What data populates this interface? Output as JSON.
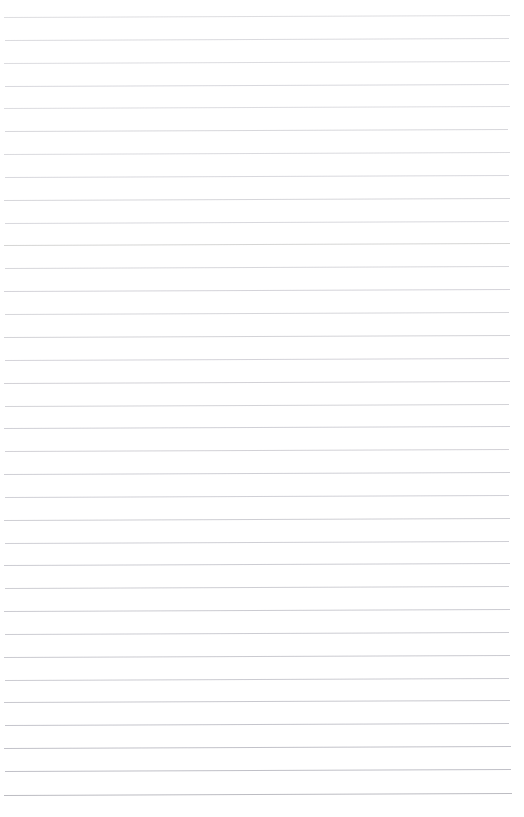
{
  "document": {
    "kind": "ruled-paper",
    "title": "Blank Lined Notebook Page",
    "page_width": 524,
    "page_height": 817,
    "background_color": "#ffffff",
    "has_text": false,
    "has_margin_rule": false,
    "has_header": false,
    "has_footer": false,
    "body_text": ""
  },
  "ruling": {
    "line_count": 35,
    "first_line_y": 17,
    "line_spacing": 22.9,
    "line_start_x": 4,
    "line_end_x": 510,
    "line_thickness": 1,
    "line_color_top": "#d2d2d6",
    "line_color_bottom": "#bcbcc2",
    "slope_px": -2,
    "lines": [
      {
        "index": 1,
        "y": 17,
        "x1": 4,
        "x2": 510,
        "color": "#d4d4d8",
        "opacity": 0.8
      },
      {
        "index": 2,
        "y": 40,
        "x1": 5,
        "x2": 509,
        "color": "#d2d2d7",
        "opacity": 0.82
      },
      {
        "index": 3,
        "y": 63,
        "x1": 4,
        "x2": 510,
        "color": "#d3d3d8",
        "opacity": 0.8
      },
      {
        "index": 4,
        "y": 86,
        "x1": 5,
        "x2": 509,
        "color": "#d1d1d6",
        "opacity": 0.84
      },
      {
        "index": 5,
        "y": 108,
        "x1": 4,
        "x2": 510,
        "color": "#d3d3d8",
        "opacity": 0.8
      },
      {
        "index": 6,
        "y": 131,
        "x1": 5,
        "x2": 508,
        "color": "#d0d0d5",
        "opacity": 0.85
      },
      {
        "index": 7,
        "y": 154,
        "x1": 4,
        "x2": 510,
        "color": "#d2d2d7",
        "opacity": 0.82
      },
      {
        "index": 8,
        "y": 177,
        "x1": 5,
        "x2": 509,
        "color": "#d1d1d6",
        "opacity": 0.84
      },
      {
        "index": 9,
        "y": 200,
        "x1": 4,
        "x2": 510,
        "color": "#cfcfd4",
        "opacity": 0.86
      },
      {
        "index": 10,
        "y": 223,
        "x1": 5,
        "x2": 509,
        "color": "#d1d1d6",
        "opacity": 0.84
      },
      {
        "index": 11,
        "y": 245,
        "x1": 4,
        "x2": 510,
        "color": "#cececd",
        "opacity": 0.86
      },
      {
        "index": 12,
        "y": 268,
        "x1": 5,
        "x2": 509,
        "color": "#d0d0d5",
        "opacity": 0.85
      },
      {
        "index": 13,
        "y": 291,
        "x1": 4,
        "x2": 510,
        "color": "#cecdd3",
        "opacity": 0.87
      },
      {
        "index": 14,
        "y": 314,
        "x1": 5,
        "x2": 509,
        "color": "#cfcfd4",
        "opacity": 0.86
      },
      {
        "index": 15,
        "y": 337,
        "x1": 4,
        "x2": 510,
        "color": "#cdcdd2",
        "opacity": 0.88
      },
      {
        "index": 16,
        "y": 360,
        "x1": 5,
        "x2": 509,
        "color": "#cecdd3",
        "opacity": 0.87
      },
      {
        "index": 17,
        "y": 383,
        "x1": 4,
        "x2": 510,
        "color": "#cccbd1",
        "opacity": 0.89
      },
      {
        "index": 18,
        "y": 406,
        "x1": 5,
        "x2": 509,
        "color": "#cdcdd2",
        "opacity": 0.88
      },
      {
        "index": 19,
        "y": 428,
        "x1": 4,
        "x2": 510,
        "color": "#cbcbd1",
        "opacity": 0.9
      },
      {
        "index": 20,
        "y": 451,
        "x1": 5,
        "x2": 509,
        "color": "#cccbd1",
        "opacity": 0.89
      },
      {
        "index": 21,
        "y": 474,
        "x1": 4,
        "x2": 510,
        "color": "#cacad0",
        "opacity": 0.9
      },
      {
        "index": 22,
        "y": 497,
        "x1": 5,
        "x2": 509,
        "color": "#cbcbd1",
        "opacity": 0.9
      },
      {
        "index": 23,
        "y": 520,
        "x1": 4,
        "x2": 510,
        "color": "#c9c9cf",
        "opacity": 0.91
      },
      {
        "index": 24,
        "y": 543,
        "x1": 5,
        "x2": 509,
        "color": "#cacad0",
        "opacity": 0.9
      },
      {
        "index": 25,
        "y": 565,
        "x1": 4,
        "x2": 510,
        "color": "#c8c8ce",
        "opacity": 0.92
      },
      {
        "index": 26,
        "y": 588,
        "x1": 5,
        "x2": 509,
        "color": "#c9c9cf",
        "opacity": 0.91
      },
      {
        "index": 27,
        "y": 611,
        "x1": 4,
        "x2": 510,
        "color": "#c7c7cd",
        "opacity": 0.92
      },
      {
        "index": 28,
        "y": 634,
        "x1": 5,
        "x2": 509,
        "color": "#c8c8ce",
        "opacity": 0.92
      },
      {
        "index": 29,
        "y": 657,
        "x1": 4,
        "x2": 510,
        "color": "#c6c6cc",
        "opacity": 0.93
      },
      {
        "index": 30,
        "y": 680,
        "x1": 5,
        "x2": 509,
        "color": "#c7c7cd",
        "opacity": 0.92
      },
      {
        "index": 31,
        "y": 702,
        "x1": 4,
        "x2": 510,
        "color": "#c5c5cb",
        "opacity": 0.94
      },
      {
        "index": 32,
        "y": 725,
        "x1": 5,
        "x2": 509,
        "color": "#c2c2c9",
        "opacity": 0.95
      },
      {
        "index": 33,
        "y": 748,
        "x1": 4,
        "x2": 511,
        "color": "#c0c0c7",
        "opacity": 0.96
      },
      {
        "index": 34,
        "y": 771,
        "x1": 5,
        "x2": 511,
        "color": "#bebec5",
        "opacity": 0.97
      },
      {
        "index": 35,
        "y": 795,
        "x1": 4,
        "x2": 512,
        "color": "#bcbcc2",
        "opacity": 1.0
      }
    ]
  }
}
